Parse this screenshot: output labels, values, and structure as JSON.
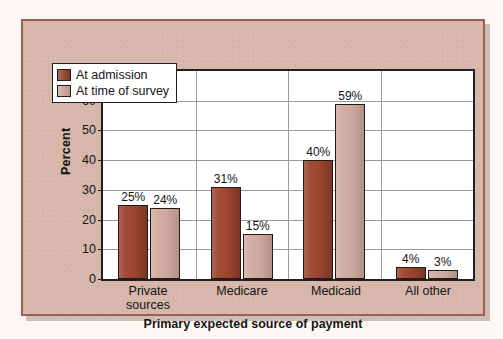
{
  "chart_data": {
    "type": "bar",
    "title": "",
    "xlabel": "Primary expected source of payment",
    "ylabel": "Percent",
    "ylim": [
      0,
      70
    ],
    "yticks": [
      0,
      10,
      20,
      30,
      40,
      50,
      60,
      70
    ],
    "ytick_labels": [
      "0",
      "10",
      "20",
      "30",
      "40",
      "50",
      "60",
      "70"
    ],
    "grid": "horizontal-and-category-separators",
    "legend_position": "upper-left-inside",
    "categories": [
      "Private sources",
      "Medicare",
      "Medicaid",
      "All other"
    ],
    "category_lines": [
      [
        "Private",
        "sources"
      ],
      [
        "Medicare"
      ],
      [
        "Medicaid"
      ],
      [
        "All other"
      ]
    ],
    "series": [
      {
        "name": "At admission",
        "color": "#9d4530",
        "values": [
          25,
          31,
          40,
          4
        ],
        "value_labels": [
          "25%",
          "31%",
          "40%",
          "4%"
        ]
      },
      {
        "name": "At time of survey",
        "color": "#cfa99f",
        "values": [
          24,
          15,
          59,
          3
        ],
        "value_labels": [
          "24%",
          "15%",
          "59%",
          "3%"
        ]
      }
    ]
  },
  "legend": {
    "items": [
      {
        "label": "At admission",
        "swatch": "dark-red-swatch"
      },
      {
        "label": "At time of survey",
        "swatch": "light-pink-swatch"
      }
    ]
  },
  "colors": {
    "panel_background": "#d7b6ab",
    "panel_border": "#9d5f52",
    "page_background": "#fbf8f4",
    "plot_background": "#ffffff",
    "axis": "#231f1c",
    "gridline": "#9b9b9b",
    "series_admission": "#9d4530",
    "series_survey": "#cfa99f",
    "text": "#141414"
  }
}
